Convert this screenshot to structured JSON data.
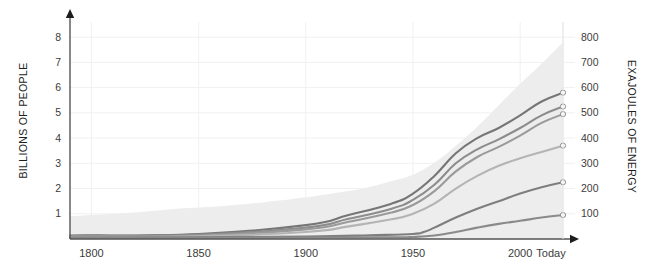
{
  "chart_data": {
    "type": "area",
    "title": "",
    "subtitle": "",
    "xlabel": "",
    "ylabel": "BILLIONS OF PEOPLE",
    "y2label": "EXAJOULES OF ENERGY",
    "xlim": [
      1790,
      2020
    ],
    "ylim": [
      0,
      8.6
    ],
    "y2lim": [
      0,
      860
    ],
    "grid": true,
    "legend": "none",
    "x_tick_labels": [
      "1800",
      "1850",
      "1900",
      "1950",
      "2000",
      "Today"
    ],
    "x_tick_values": [
      1800,
      1850,
      1900,
      1950,
      2000,
      2020
    ],
    "y_tick_labels": [
      "1",
      "2",
      "3",
      "4",
      "5",
      "6",
      "7",
      "8"
    ],
    "y_tick_values": [
      1,
      2,
      3,
      4,
      5,
      6,
      7,
      8
    ],
    "y2_tick_labels": [
      "100",
      "200",
      "300",
      "400",
      "500",
      "600",
      "700",
      "800"
    ],
    "y2_tick_values": [
      100,
      200,
      300,
      400,
      500,
      600,
      700,
      800
    ],
    "colors": {
      "area_fill": "#ededed",
      "grid": "#f0f0f0",
      "axis": "#555555",
      "text": "#333333",
      "series_1": "#767676",
      "series_2": "#8c8c8c",
      "series_3": "#9a9a9a",
      "series_4": "#b4b4b4",
      "series_5": "#7e7e7e",
      "series_6": "#8a8a8a",
      "marker_stroke": "#8a8a8a"
    },
    "series": [
      {
        "name": "population-area",
        "kind": "area",
        "axis": "left",
        "color": "#ededed",
        "x": [
          1790,
          1800,
          1820,
          1840,
          1860,
          1880,
          1900,
          1920,
          1930,
          1940,
          1950,
          1960,
          1970,
          1980,
          1990,
          2000,
          2010,
          2020
        ],
        "values": [
          0.9,
          0.95,
          1.05,
          1.2,
          1.3,
          1.45,
          1.65,
          1.9,
          2.07,
          2.3,
          2.55,
          3.03,
          3.7,
          4.45,
          5.3,
          6.15,
          6.95,
          7.8
        ]
      },
      {
        "name": "series-top",
        "kind": "line",
        "axis": "right",
        "color": "#767676",
        "x": [
          1790,
          1850,
          1900,
          1920,
          1940,
          1950,
          1960,
          1970,
          1980,
          1990,
          2000,
          2010,
          2020
        ],
        "values": [
          14,
          20,
          55,
          95,
          140,
          180,
          250,
          340,
          400,
          440,
          490,
          545,
          580
        ]
      },
      {
        "name": "series-second",
        "kind": "line",
        "axis": "right",
        "color": "#8c8c8c",
        "x": [
          1790,
          1850,
          1900,
          1920,
          1940,
          1950,
          1960,
          1970,
          1980,
          1990,
          2000,
          2010,
          2020
        ],
        "values": [
          12,
          17,
          45,
          80,
          120,
          155,
          215,
          300,
          355,
          395,
          440,
          490,
          525
        ]
      },
      {
        "name": "series-third",
        "kind": "line",
        "axis": "right",
        "color": "#9a9a9a",
        "x": [
          1790,
          1850,
          1900,
          1920,
          1940,
          1950,
          1960,
          1970,
          1980,
          1990,
          2000,
          2010,
          2020
        ],
        "values": [
          10,
          14,
          38,
          68,
          105,
          135,
          190,
          268,
          325,
          365,
          410,
          460,
          495
        ]
      },
      {
        "name": "series-fourth",
        "kind": "line",
        "axis": "right",
        "color": "#b4b4b4",
        "x": [
          1790,
          1850,
          1900,
          1920,
          1940,
          1950,
          1960,
          1970,
          1980,
          1990,
          2000,
          2010,
          2020
        ],
        "values": [
          8,
          11,
          28,
          50,
          78,
          100,
          140,
          200,
          250,
          290,
          320,
          345,
          370
        ]
      },
      {
        "name": "series-fifth",
        "kind": "line",
        "axis": "right",
        "color": "#7e7e7e",
        "x": [
          1790,
          1850,
          1900,
          1930,
          1950,
          1955,
          1960,
          1970,
          1980,
          1990,
          2000,
          2010,
          2020
        ],
        "values": [
          6,
          7,
          10,
          15,
          20,
          28,
          45,
          85,
          120,
          150,
          180,
          205,
          225
        ]
      },
      {
        "name": "series-sixth",
        "kind": "line",
        "axis": "right",
        "color": "#8a8a8a",
        "x": [
          1790,
          1850,
          1900,
          1940,
          1950,
          1960,
          1970,
          1980,
          1990,
          2000,
          2010,
          2020
        ],
        "values": [
          5,
          5,
          6,
          7,
          8,
          14,
          28,
          45,
          60,
          72,
          85,
          95
        ]
      }
    ],
    "endpoint_markers": [
      {
        "series": "series-top",
        "value": 580
      },
      {
        "series": "series-second",
        "value": 525
      },
      {
        "series": "series-third",
        "value": 495
      },
      {
        "series": "series-fourth",
        "value": 370
      },
      {
        "series": "series-fifth",
        "value": 225
      },
      {
        "series": "series-sixth",
        "value": 95
      }
    ]
  }
}
